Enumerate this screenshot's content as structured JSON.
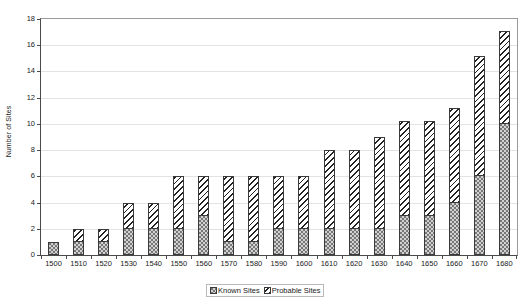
{
  "chart_data": {
    "type": "bar",
    "title": "",
    "xlabel": "",
    "ylabel": "Number of Sites",
    "ylim": [
      0,
      18
    ],
    "ytick_step": 2,
    "yticks": [
      0,
      2,
      4,
      6,
      8,
      10,
      12,
      14,
      16,
      18
    ],
    "grid": true,
    "stacked": true,
    "legend_position": "bottom-center",
    "categories": [
      "1500",
      "1510",
      "1520",
      "1530",
      "1540",
      "1550",
      "1560",
      "1570",
      "1580",
      "1590",
      "1600",
      "1610",
      "1620",
      "1630",
      "1640",
      "1650",
      "1660",
      "1670",
      "1680"
    ],
    "series": [
      {
        "name": "Known Sites",
        "pattern": "dotted",
        "values": [
          1,
          1,
          1,
          2,
          2,
          2,
          3,
          1,
          1,
          2,
          2,
          2,
          2,
          2,
          3,
          3,
          4,
          6,
          10
        ]
      },
      {
        "name": "Probable Sites",
        "pattern": "diagonal-hatch",
        "values": [
          0,
          1,
          1,
          2,
          2,
          4,
          3,
          5,
          5,
          4,
          4,
          6,
          6,
          7,
          7.2,
          7.2,
          7.2,
          9.2,
          7.1
        ]
      }
    ],
    "totals": [
      1,
      2,
      2,
      4,
      4,
      6,
      6,
      6,
      6,
      6,
      6,
      8,
      8,
      9,
      10.2,
      10.2,
      11.2,
      15.2,
      17.1
    ]
  },
  "legend": {
    "items": [
      {
        "label": "Known Sites",
        "swatch": "known"
      },
      {
        "label": "Probable Sites",
        "swatch": "probable"
      }
    ]
  },
  "colors": {
    "axis": "#4a4a4a",
    "gridline": "#e3e3e3",
    "known_fill": "#d2d2d2",
    "probable_fill": "#ffffff",
    "text": "#1a1a1a",
    "background": "#ffffff"
  }
}
